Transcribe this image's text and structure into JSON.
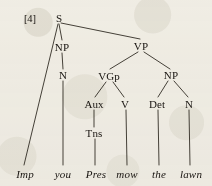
{
  "figure": {
    "example_number": "[4]",
    "sentence": "Imp you Pres mow the lawn",
    "diagram_type": "syntax-tree",
    "ink_color": "#181410",
    "paper_color": "#f4f2ec"
  },
  "nodes": [
    {
      "id": "S",
      "label": "S",
      "x": 59,
      "y": 18
    },
    {
      "id": "NP1",
      "label": "NP",
      "x": 62,
      "y": 47
    },
    {
      "id": "VP",
      "label": "VP",
      "x": 141,
      "y": 46
    },
    {
      "id": "N1",
      "label": "N",
      "x": 63,
      "y": 75
    },
    {
      "id": "VGp",
      "label": "VGp",
      "x": 109,
      "y": 76
    },
    {
      "id": "NP2",
      "label": "NP",
      "x": 171,
      "y": 75
    },
    {
      "id": "Aux",
      "label": "Aux",
      "x": 94,
      "y": 104
    },
    {
      "id": "V",
      "label": "V",
      "x": 125,
      "y": 104
    },
    {
      "id": "Det",
      "label": "Det",
      "x": 157,
      "y": 104
    },
    {
      "id": "N2",
      "label": "N",
      "x": 189,
      "y": 104
    },
    {
      "id": "Tns",
      "label": "Tns",
      "x": 94,
      "y": 133
    }
  ],
  "leaves": [
    {
      "id": "leaf-imp",
      "label": "Imp",
      "x": 25,
      "y": 174
    },
    {
      "id": "leaf-you",
      "label": "you",
      "x": 63,
      "y": 174
    },
    {
      "id": "leaf-pres",
      "label": "Pres",
      "x": 96,
      "y": 174
    },
    {
      "id": "leaf-mow",
      "label": "mow",
      "x": 127,
      "y": 174
    },
    {
      "id": "leaf-the",
      "label": "the",
      "x": 159,
      "y": 174
    },
    {
      "id": "leaf-lawn",
      "label": "lawn",
      "x": 191,
      "y": 174
    }
  ],
  "edges": [
    {
      "from": "S",
      "to": "leaf-imp",
      "x1": 58,
      "y1": 24,
      "x2": 24,
      "y2": 165
    },
    {
      "from": "S",
      "to": "NP1",
      "x1": 59,
      "y1": 24,
      "x2": 62,
      "y2": 40
    },
    {
      "from": "S",
      "to": "VP",
      "x1": 61,
      "y1": 23,
      "x2": 140,
      "y2": 39
    },
    {
      "from": "NP1",
      "to": "N1",
      "x1": 62,
      "y1": 53,
      "x2": 63,
      "y2": 69
    },
    {
      "from": "N1",
      "to": "leaf-you",
      "x1": 63,
      "y1": 81,
      "x2": 63,
      "y2": 165
    },
    {
      "from": "VP",
      "to": "VGp",
      "x1": 138,
      "y1": 52,
      "x2": 110,
      "y2": 69
    },
    {
      "from": "VP",
      "to": "NP2",
      "x1": 144,
      "y1": 52,
      "x2": 170,
      "y2": 69
    },
    {
      "from": "VGp",
      "to": "Aux",
      "x1": 106,
      "y1": 82,
      "x2": 95,
      "y2": 97
    },
    {
      "from": "VGp",
      "to": "V",
      "x1": 113,
      "y1": 82,
      "x2": 124,
      "y2": 97
    },
    {
      "from": "NP2",
      "to": "Det",
      "x1": 168,
      "y1": 81,
      "x2": 158,
      "y2": 97
    },
    {
      "from": "NP2",
      "to": "N2",
      "x1": 174,
      "y1": 81,
      "x2": 188,
      "y2": 97
    },
    {
      "from": "Aux",
      "to": "Tns",
      "x1": 94,
      "y1": 110,
      "x2": 94,
      "y2": 127
    },
    {
      "from": "Tns",
      "to": "leaf-pres",
      "x1": 95,
      "y1": 139,
      "x2": 95,
      "y2": 165
    },
    {
      "from": "V",
      "to": "leaf-mow",
      "x1": 126,
      "y1": 110,
      "x2": 127,
      "y2": 165
    },
    {
      "from": "Det",
      "to": "leaf-the",
      "x1": 158,
      "y1": 110,
      "x2": 159,
      "y2": 165
    },
    {
      "from": "N2",
      "to": "leaf-lawn",
      "x1": 189,
      "y1": 110,
      "x2": 190,
      "y2": 165
    }
  ],
  "annotation": {
    "label_x": 30,
    "label_y": 18
  }
}
